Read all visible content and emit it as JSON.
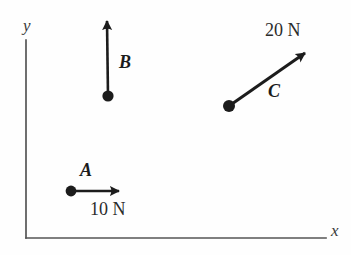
{
  "figure": {
    "kind": "force-vector-diagram",
    "background_color": "#fefefe",
    "ink_color": "#1c1c1c",
    "axis_color": "#555555",
    "width": 351,
    "height": 255
  },
  "axes": {
    "x_label": "x",
    "y_label": "y",
    "origin": {
      "x": 26,
      "y": 238
    },
    "x_end": {
      "x": 326,
      "y": 238
    },
    "y_end": {
      "x": 26,
      "y": 40
    }
  },
  "vectors": [
    {
      "id": "A",
      "label": "A",
      "magnitude_label": "10 N",
      "tail": {
        "x": 71,
        "y": 191
      },
      "tip": {
        "x": 120,
        "y": 191
      },
      "direction_deg": 0,
      "color": "#1c1c1c"
    },
    {
      "id": "B",
      "label": "B",
      "magnitude_label": "",
      "tail": {
        "x": 108,
        "y": 96
      },
      "tip": {
        "x": 107,
        "y": 19
      },
      "direction_deg": 90,
      "color": "#1c1c1c"
    },
    {
      "id": "C",
      "label": "C",
      "magnitude_label": "20 N",
      "tail": {
        "x": 229,
        "y": 106
      },
      "tip": {
        "x": 307,
        "y": 51
      },
      "direction_deg": 35,
      "color": "#1c1c1c"
    }
  ],
  "labels": {
    "vector_a": "A",
    "vector_b": "B",
    "vector_c": "C",
    "magnitude_a": "10 N",
    "magnitude_c": "20 N",
    "axis_x": "x",
    "axis_y": "y"
  }
}
